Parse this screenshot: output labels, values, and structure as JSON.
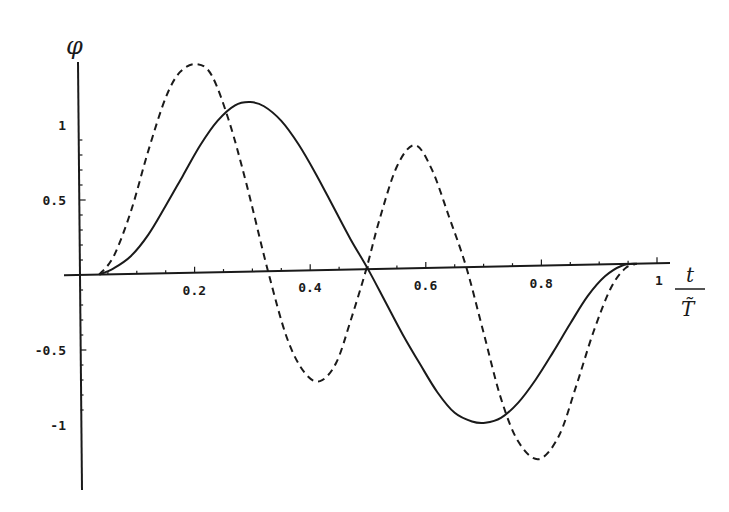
{
  "chart_data": {
    "type": "line",
    "title": "",
    "xlabel": "t / T̃",
    "ylabel": "φ",
    "xlabel_num": "t",
    "xlabel_den": "T̃",
    "xlim": [
      0,
      1.05
    ],
    "ylim": [
      -1.4,
      1.4
    ],
    "grid": false,
    "legend": null,
    "x_ticks": [
      0.2,
      0.4,
      0.6,
      0.8,
      1
    ],
    "x_tick_labels": [
      "0.2",
      "0.4",
      "0.6",
      "0.8",
      "1"
    ],
    "y_ticks": [
      -1,
      -0.5,
      0.5,
      1
    ],
    "y_tick_labels": [
      "-1",
      "-0.5",
      "0.5",
      "1"
    ],
    "series": [
      {
        "name": "solid",
        "style": "solid",
        "color": "#1a1a1a",
        "x": [
          0.035,
          0.06,
          0.09,
          0.12,
          0.15,
          0.18,
          0.21,
          0.24,
          0.27,
          0.296,
          0.32,
          0.35,
          0.38,
          0.41,
          0.44,
          0.47,
          0.5,
          0.53,
          0.56,
          0.59,
          0.62,
          0.65,
          0.68,
          0.703,
          0.73,
          0.76,
          0.79,
          0.82,
          0.85,
          0.88,
          0.91,
          0.94,
          0.965
        ],
        "y": [
          0.0,
          0.04,
          0.12,
          0.26,
          0.45,
          0.65,
          0.85,
          1.01,
          1.11,
          1.13,
          1.1,
          1.0,
          0.84,
          0.64,
          0.42,
          0.2,
          0.0,
          -0.22,
          -0.44,
          -0.64,
          -0.83,
          -0.97,
          -1.03,
          -1.04,
          -1.01,
          -0.91,
          -0.76,
          -0.58,
          -0.39,
          -0.21,
          -0.08,
          -0.01,
          0.0
        ]
      },
      {
        "name": "dashed",
        "style": "dashed",
        "color": "#1a1a1a",
        "x": [
          0.035,
          0.06,
          0.09,
          0.12,
          0.15,
          0.175,
          0.204,
          0.23,
          0.26,
          0.29,
          0.327,
          0.36,
          0.39,
          0.417,
          0.445,
          0.47,
          0.497,
          0.52,
          0.55,
          0.581,
          0.61,
          0.64,
          0.67,
          0.7,
          0.73,
          0.76,
          0.795,
          0.83,
          0.86,
          0.89,
          0.92,
          0.945,
          0.965
        ],
        "y": [
          0.0,
          0.12,
          0.42,
          0.82,
          1.17,
          1.34,
          1.39,
          1.31,
          1.0,
          0.58,
          0.0,
          -0.45,
          -0.68,
          -0.74,
          -0.62,
          -0.34,
          0.0,
          0.33,
          0.68,
          0.82,
          0.66,
          0.34,
          0.0,
          -0.44,
          -0.88,
          -1.17,
          -1.29,
          -1.14,
          -0.81,
          -0.45,
          -0.16,
          -0.03,
          0.0
        ]
      }
    ]
  }
}
